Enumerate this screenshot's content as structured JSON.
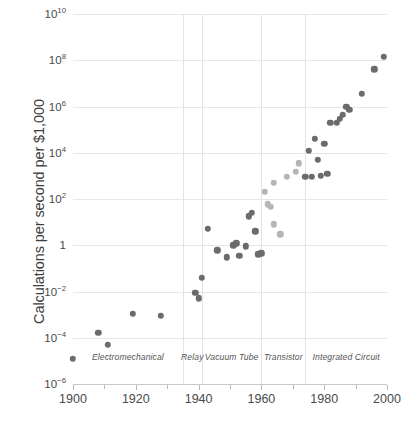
{
  "chart_data": {
    "type": "scatter",
    "title": "",
    "xlabel": "",
    "ylabel": "Calculations per second per $1,000",
    "xlim": [
      1900,
      2000
    ],
    "ylim": [
      1e-06,
      10000000000.0
    ],
    "yscale": "log",
    "grid": true,
    "legend": null,
    "x_ticks": [
      1900,
      1920,
      1940,
      1960,
      1980,
      2000
    ],
    "x_tick_labels": [
      "1900",
      "1920",
      "1940",
      "1960",
      "1980",
      "2000"
    ],
    "x_minor_ticks": [
      1910,
      1930,
      1950,
      1970,
      1990
    ],
    "y_ticks": [
      10000000000.0,
      100000000.0,
      1000000.0,
      10000.0,
      100.0,
      1,
      0.01,
      0.0001,
      1e-06
    ],
    "y_tick_labels": [
      "10^10",
      "10^8",
      "10^6",
      "10^4",
      "10^2",
      "1",
      "10^-2",
      "10^-4",
      "10^-6"
    ],
    "eras": [
      {
        "name": "Electromechanical",
        "start": 1900,
        "end": 1935,
        "center": 1917.5
      },
      {
        "name": "Relay",
        "start": 1935,
        "end": 1941,
        "center": 1938.0
      },
      {
        "name": "Vacuum Tube",
        "start": 1941,
        "end": 1960,
        "center": 1950.5
      },
      {
        "name": "Transistor",
        "start": 1960,
        "end": 1974,
        "center": 1967.0
      },
      {
        "name": "Integrated Circuit",
        "start": 1974,
        "end": 2000,
        "center": 1987.0
      }
    ],
    "era_boundaries": [
      1935,
      1941,
      1960,
      1974
    ],
    "colors": {
      "dot_dark": "#6b6b6b",
      "dot_light": "#b5b5b5",
      "gridline": "#e6e6e6",
      "axis": "#c9c9c9",
      "text": "#3c3c3c",
      "background": "#ffffff"
    },
    "points": [
      {
        "x": 1900,
        "y": 1.2e-05,
        "shade": "dark"
      },
      {
        "x": 1908,
        "y": 0.00016,
        "shade": "dark"
      },
      {
        "x": 1911,
        "y": 5e-05,
        "shade": "dark"
      },
      {
        "x": 1919,
        "y": 0.0011,
        "shade": "dark"
      },
      {
        "x": 1928,
        "y": 0.0009,
        "shade": "dark"
      },
      {
        "x": 1939,
        "y": 0.009,
        "shade": "dark"
      },
      {
        "x": 1940,
        "y": 0.005,
        "shade": "dark"
      },
      {
        "x": 1941,
        "y": 0.04,
        "shade": "dark"
      },
      {
        "x": 1943,
        "y": 5.0,
        "shade": "dark"
      },
      {
        "x": 1946,
        "y": 0.6,
        "shade": "dark"
      },
      {
        "x": 1949,
        "y": 0.3,
        "shade": "dark"
      },
      {
        "x": 1951,
        "y": 1.0,
        "shade": "dark"
      },
      {
        "x": 1952,
        "y": 1.2,
        "shade": "dark"
      },
      {
        "x": 1953,
        "y": 0.35,
        "shade": "dark"
      },
      {
        "x": 1955,
        "y": 0.9,
        "shade": "dark"
      },
      {
        "x": 1956,
        "y": 18.0,
        "shade": "dark"
      },
      {
        "x": 1957,
        "y": 25.0,
        "shade": "dark"
      },
      {
        "x": 1958,
        "y": 4.0,
        "shade": "dark"
      },
      {
        "x": 1959,
        "y": 0.4,
        "shade": "dark"
      },
      {
        "x": 1960,
        "y": 0.45,
        "shade": "dark"
      },
      {
        "x": 1961,
        "y": 200.0,
        "shade": "light"
      },
      {
        "x": 1962,
        "y": 60.0,
        "shade": "light"
      },
      {
        "x": 1963,
        "y": 45.0,
        "shade": "light"
      },
      {
        "x": 1964,
        "y": 500.0,
        "shade": "light"
      },
      {
        "x": 1964,
        "y": 8.0,
        "shade": "light"
      },
      {
        "x": 1966,
        "y": 3.0,
        "shade": "light"
      },
      {
        "x": 1968,
        "y": 900.0,
        "shade": "light"
      },
      {
        "x": 1971,
        "y": 1500.0,
        "shade": "light"
      },
      {
        "x": 1972,
        "y": 3500.0,
        "shade": "light"
      },
      {
        "x": 1974,
        "y": 900.0,
        "shade": "dark"
      },
      {
        "x": 1975,
        "y": 12000.0,
        "shade": "dark"
      },
      {
        "x": 1976,
        "y": 900.0,
        "shade": "dark"
      },
      {
        "x": 1977,
        "y": 40000.0,
        "shade": "dark"
      },
      {
        "x": 1978,
        "y": 5000.0,
        "shade": "dark"
      },
      {
        "x": 1979,
        "y": 1000.0,
        "shade": "dark"
      },
      {
        "x": 1980,
        "y": 25000.0,
        "shade": "dark"
      },
      {
        "x": 1981,
        "y": 1200.0,
        "shade": "dark"
      },
      {
        "x": 1982,
        "y": 200000.0,
        "shade": "dark"
      },
      {
        "x": 1984,
        "y": 200000.0,
        "shade": "dark"
      },
      {
        "x": 1985,
        "y": 300000.0,
        "shade": "dark"
      },
      {
        "x": 1986,
        "y": 450000.0,
        "shade": "dark"
      },
      {
        "x": 1987,
        "y": 1000000.0,
        "shade": "dark"
      },
      {
        "x": 1988,
        "y": 700000.0,
        "shade": "dark"
      },
      {
        "x": 1992,
        "y": 3500000.0,
        "shade": "dark"
      },
      {
        "x": 1996,
        "y": 40000000.0,
        "shade": "dark"
      },
      {
        "x": 1999,
        "y": 140000000.0,
        "shade": "dark"
      }
    ]
  }
}
